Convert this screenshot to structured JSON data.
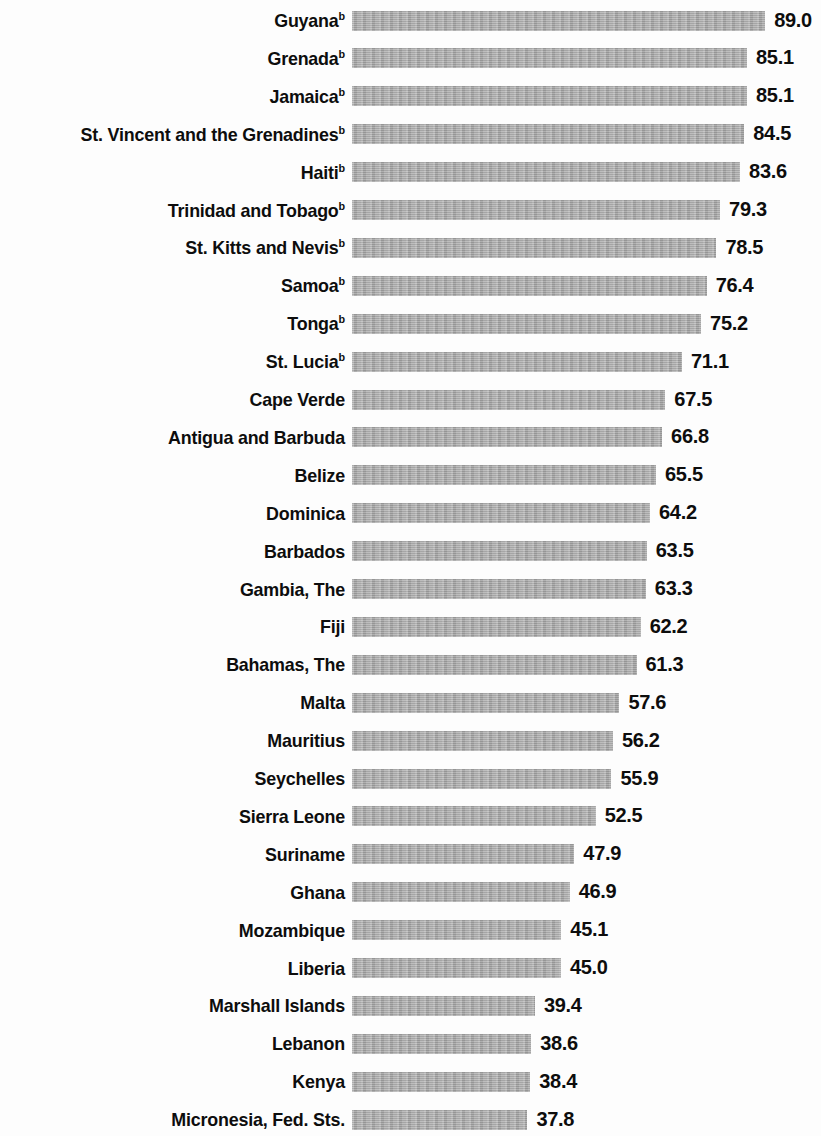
{
  "chart_data": {
    "type": "bar",
    "orientation": "horizontal",
    "title": "",
    "subtitle": "",
    "xlabel": "",
    "ylabel": "",
    "grid": false,
    "legend": null,
    "axis_visible": false,
    "xlim": [
      0,
      89.0
    ],
    "value_format": "one_decimal",
    "bar_color": "#a9a9a9",
    "label_color": "#0d0d0d",
    "footnote_marker": "b",
    "footnote_marker_note": "Superscript b appears on the first ten country labels",
    "categories": [
      "Guyana",
      "Grenada",
      "Jamaica",
      "St. Vincent and the Grenadines",
      "Haiti",
      "Trinidad and Tobago",
      "St. Kitts and Nevis",
      "Samoa",
      "Tonga",
      "St. Lucia",
      "Cape Verde",
      "Antigua and Barbuda",
      "Belize",
      "Dominica",
      "Barbados",
      "Gambia, The",
      "Fiji",
      "Bahamas, The",
      "Malta",
      "Mauritius",
      "Seychelles",
      "Sierra Leone",
      "Suriname",
      "Ghana",
      "Mozambique",
      "Liberia",
      "Marshall Islands",
      "Lebanon",
      "Kenya",
      "Micronesia, Fed. Sts."
    ],
    "values": [
      89.0,
      85.1,
      85.1,
      84.5,
      83.6,
      79.3,
      78.5,
      76.4,
      75.2,
      71.1,
      67.5,
      66.8,
      65.5,
      64.2,
      63.5,
      63.3,
      62.2,
      61.3,
      57.6,
      56.2,
      55.9,
      52.5,
      47.9,
      46.9,
      45.1,
      45.0,
      39.4,
      38.6,
      38.4,
      37.8
    ],
    "value_labels": [
      "89.0",
      "85.1",
      "85.1",
      "84.5",
      "83.6",
      "79.3",
      "78.5",
      "76.4",
      "75.2",
      "71.1",
      "67.5",
      "66.8",
      "65.5",
      "64.2",
      "63.5",
      "63.3",
      "62.2",
      "61.3",
      "57.6",
      "56.2",
      "55.9",
      "52.5",
      "47.9",
      "46.9",
      "45.1",
      "45.0",
      "39.4",
      "38.6",
      "38.4",
      "37.8"
    ],
    "marked_rows": [
      0,
      1,
      2,
      3,
      4,
      5,
      6,
      7,
      8,
      9
    ]
  }
}
